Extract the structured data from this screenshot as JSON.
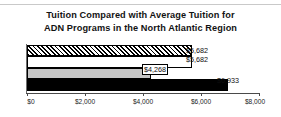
{
  "chart_data": {
    "type": "bar",
    "orientation": "horizontal",
    "title": "Tuition Compared with Average Tuition for ADN Programs in the North Atlantic Region",
    "title_lines": [
      "Tuition Compared with Average Tuition for",
      "ADN Programs in the North Atlantic Region"
    ],
    "xlabel": "",
    "ylabel": "",
    "xlim": [
      0,
      8000
    ],
    "grid": false,
    "legend": "none",
    "categories": [
      "Series 1",
      "Series 2",
      "Series 3",
      "Series 4"
    ],
    "values": [
      5682,
      5682,
      4268,
      6933
    ],
    "bars": [
      {
        "value": 5682,
        "label": "$5,682",
        "fill": "hatch",
        "label_boxed": false
      },
      {
        "value": 5682,
        "label": "$5,682",
        "fill": "white",
        "label_boxed": false
      },
      {
        "value": 4268,
        "label": "$4,268",
        "fill": "gray",
        "label_boxed": true
      },
      {
        "value": 6933,
        "label": "$6,933",
        "fill": "black",
        "label_boxed": false
      }
    ],
    "xticks": [
      0,
      2000,
      4000,
      6000,
      8000
    ],
    "xticklabels": [
      "$0",
      "$2,000",
      "$4,000",
      "$6,000",
      "$8,000"
    ],
    "colors": {
      "axis": "#4a4a4a",
      "text": "#131313",
      "bar_gray": "#c6c6c6",
      "bar_black": "#000000",
      "bar_white": "#ffffff",
      "background": "#ffffff"
    }
  }
}
